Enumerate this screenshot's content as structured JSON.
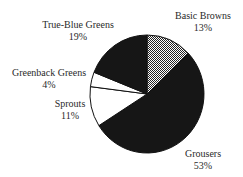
{
  "chart_data": {
    "type": "pie",
    "title": "",
    "start_angle": "12 o'clock",
    "direction": "clockwise",
    "legend": "none (direct labels)",
    "slices": [
      {
        "label": "Basic Browns",
        "value": 13,
        "value_label": "13%",
        "fill": "pattern-gray-dither"
      },
      {
        "label": "Grousers",
        "value": 53,
        "value_label": "53%",
        "fill": "#161616"
      },
      {
        "label": "Sprouts",
        "value": 11,
        "value_label": "11%",
        "fill": "#ffffff"
      },
      {
        "label": "Greenback Greens",
        "value": 4,
        "value_label": "4%",
        "fill": "#ffffff"
      },
      {
        "label": "True-Blue Greens",
        "value": 19,
        "value_label": "19%",
        "fill": "#161616"
      }
    ],
    "categories": [
      "Basic Browns",
      "Grousers",
      "Sprouts",
      "Greenback Greens",
      "True-Blue Greens"
    ],
    "values": [
      13,
      53,
      11,
      4,
      19
    ]
  },
  "colors": {
    "dark": "#161616",
    "light": "#ffffff",
    "stroke": "#111111",
    "text": "#2a2a2a"
  }
}
